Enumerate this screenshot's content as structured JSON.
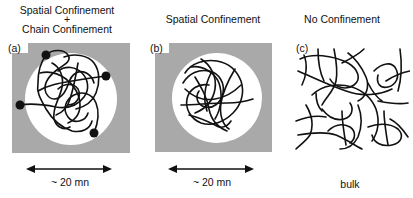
{
  "panels": [
    {
      "id": "a",
      "label": "(a)",
      "title_line1": "Spatial Confinement",
      "title_plus": "+",
      "title_line2": "Chain Confinement",
      "scale": "~ 20 mn"
    },
    {
      "id": "b",
      "label": "(b)",
      "title": "Spatial Confinement",
      "scale": "~ 20 mn"
    },
    {
      "id": "c",
      "label": "(c)",
      "title": "No Confinement",
      "caption": "bulk"
    }
  ],
  "colors": {
    "matrix_gray": "#a9a9a9",
    "pore_white": "#ffffff",
    "chain_black": "#111111"
  }
}
